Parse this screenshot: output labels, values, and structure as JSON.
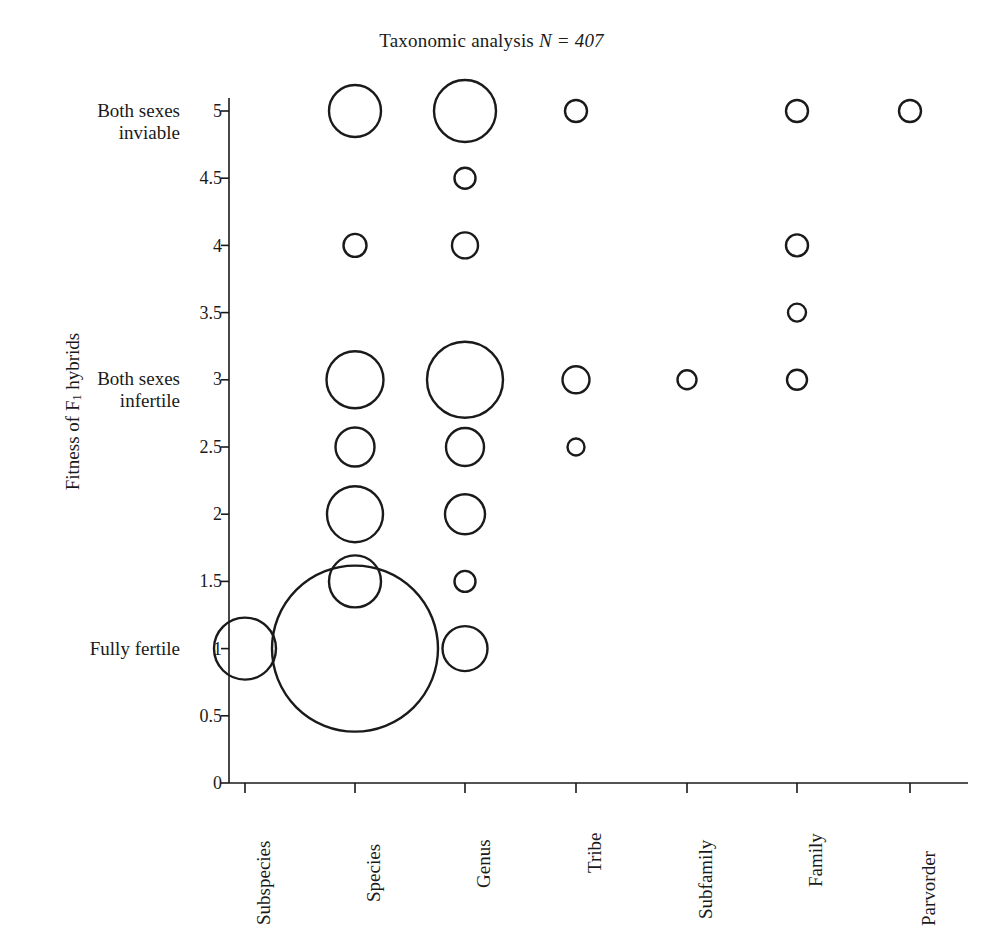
{
  "chart_data": {
    "type": "scatter",
    "title": "Taxonomic analysis N = 407",
    "title_main": "Taxonomic analysis ",
    "title_stat": "N = 407",
    "sample_size": 407,
    "xlabel": "",
    "ylabel": "Fitness of F1 hybrids",
    "ylabel_prefix": "Fitness of F",
    "ylabel_sub": "1",
    "ylabel_suffix": " hybrids",
    "grid": false,
    "legend": "none",
    "marker_style": "open-circle",
    "marker_color": "#1a1a1a",
    "size_encoding": "bubble area proportional to count",
    "categories": [
      "Subspecies",
      "Species",
      "Genus",
      "Tribe",
      "Subfamily",
      "Family",
      "Parvorder"
    ],
    "ylim": [
      0,
      5.25
    ],
    "yticks": [
      0,
      0.5,
      1,
      1.5,
      2,
      2.5,
      3,
      3.5,
      4,
      4.5,
      5
    ],
    "ytick_labels": [
      "0",
      "0.5",
      "1",
      "1.5",
      "2",
      "2.5",
      "3",
      "3.5",
      "4",
      "4.5",
      "5"
    ],
    "y_category_labels": [
      {
        "value": 5,
        "label_line1": "Both sexes",
        "label_line2": "inviable"
      },
      {
        "value": 3,
        "label_line1": "Both sexes",
        "label_line2": "infertile"
      },
      {
        "value": 1,
        "label_line1": "Fully fertile",
        "label_line2": ""
      }
    ],
    "points": [
      {
        "x": "Species",
        "y": 5,
        "size": 52
      },
      {
        "x": "Genus",
        "y": 5,
        "size": 62
      },
      {
        "x": "Tribe",
        "y": 5,
        "size": 22
      },
      {
        "x": "Family",
        "y": 5,
        "size": 22
      },
      {
        "x": "Parvorder",
        "y": 5,
        "size": 22
      },
      {
        "x": "Genus",
        "y": 4.5,
        "size": 21
      },
      {
        "x": "Species",
        "y": 4,
        "size": 23
      },
      {
        "x": "Genus",
        "y": 4,
        "size": 26
      },
      {
        "x": "Family",
        "y": 4,
        "size": 22
      },
      {
        "x": "Family",
        "y": 3.5,
        "size": 18
      },
      {
        "x": "Species",
        "y": 3,
        "size": 57
      },
      {
        "x": "Genus",
        "y": 3,
        "size": 76
      },
      {
        "x": "Tribe",
        "y": 3,
        "size": 27
      },
      {
        "x": "Subfamily",
        "y": 3,
        "size": 19
      },
      {
        "x": "Family",
        "y": 3,
        "size": 20
      },
      {
        "x": "Species",
        "y": 2.5,
        "size": 39
      },
      {
        "x": "Genus",
        "y": 2.5,
        "size": 38
      },
      {
        "x": "Tribe",
        "y": 2.5,
        "size": 17
      },
      {
        "x": "Species",
        "y": 2,
        "size": 56
      },
      {
        "x": "Genus",
        "y": 2,
        "size": 40
      },
      {
        "x": "Species",
        "y": 1.5,
        "size": 52
      },
      {
        "x": "Genus",
        "y": 1.5,
        "size": 21
      },
      {
        "x": "Subspecies",
        "y": 1,
        "size": 62
      },
      {
        "x": "Species",
        "y": 1,
        "size": 166
      },
      {
        "x": "Genus",
        "y": 1,
        "size": 45
      }
    ]
  }
}
